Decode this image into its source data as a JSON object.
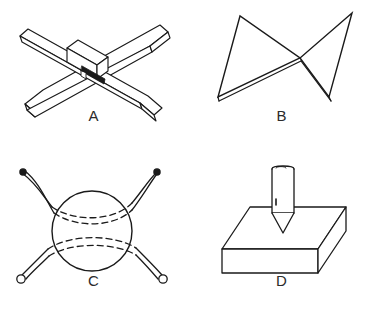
{
  "sheet": {
    "background_color": "#ffffff",
    "ink_color": "#1a1a1a",
    "width": 375,
    "height": 309
  },
  "figures": [
    {
      "label": "A",
      "name": "cross-bars-with-center-block",
      "description": "Isometric line drawing of two flat rectangular bars crossing in an X, joined by a small rectangular block at the center with a dark slot",
      "style": "line-art"
    },
    {
      "label": "B",
      "name": "bowtie-twisted-band",
      "description": "Hourglass / bowtie outline of two triangles meeting at a central crossing point, lower edges drawn as a narrow doubled band",
      "style": "line-art"
    },
    {
      "label": "C",
      "name": "sphere-with-crossing-bands",
      "description": "Circle representing a sphere with two curved ribbon bands crossing through it, dashed where hidden behind the sphere, solid round tips at top and small open circles at bottom",
      "style": "line-art"
    },
    {
      "label": "D",
      "name": "punch-over-slab",
      "description": "Isometric rectangular slab with a vertical cylindrical punch with a pointed conical tip positioned above its top face",
      "style": "line-art"
    }
  ]
}
